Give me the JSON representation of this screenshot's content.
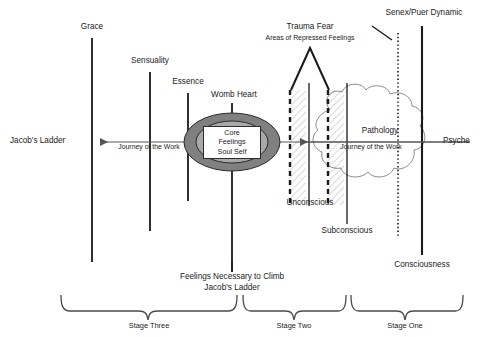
{
  "diagram": {
    "background_color": "#ffffff",
    "ink_color": "#1a1a1a",
    "ellipse_outer_color": "#808080",
    "ellipse_inner_color": "#a9a9a9",
    "core_box_color": "#ffffff"
  },
  "axis": {
    "left_label": "Jacob's Ladder",
    "right_label": "Psyche",
    "journey_label_left": "Journey of the Work",
    "journey_label_right": "Journey of the Work"
  },
  "columns": [
    {
      "name": "grace",
      "label": "Grace"
    },
    {
      "name": "sensuality",
      "label": "Sensuality"
    },
    {
      "name": "essence",
      "label": "Essence"
    },
    {
      "name": "womb-heart",
      "label": "Womb Heart"
    },
    {
      "name": "unconscious",
      "label": "Unconscious"
    },
    {
      "name": "subconscious",
      "label": "Subconscious"
    },
    {
      "name": "consciousness",
      "label": "Consciousness"
    }
  ],
  "core": {
    "line1": "Core",
    "line2": "Feelings",
    "line3": "Soul Self"
  },
  "annotations": {
    "trauma_title": "Trauma Fear",
    "trauma_subtitle": "Areas of Repressed Feelings",
    "pathology": "Pathology",
    "senex_puer": "Senex/Puer Dynamic",
    "feelings_line1": "Feelings Necessary to Climb",
    "feelings_line2": "Jacob's Ladder"
  },
  "stages": [
    {
      "name": "stage-three",
      "label": "Stage Three"
    },
    {
      "name": "stage-two",
      "label": "Stage Two"
    },
    {
      "name": "stage-one",
      "label": "Stage One"
    }
  ]
}
